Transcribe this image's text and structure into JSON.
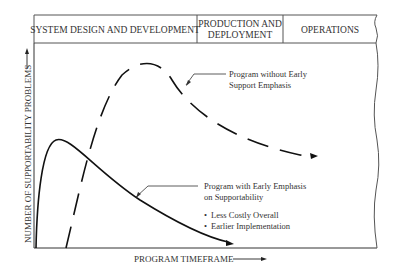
{
  "phases": [
    {
      "label": "SYSTEM DESIGN AND DEVELOPMENT"
    },
    {
      "label_line1": "PRODUCTION AND",
      "label_line2": "DEPLOYMENT"
    },
    {
      "label": "OPERATIONS"
    }
  ],
  "axes": {
    "y_label": "NUMBER OF SUPPORTABILITY PROBLEMS",
    "x_label": "PROGRAM TIMEFRAME"
  },
  "curves": {
    "without": {
      "label_line1": "Program without Early",
      "label_line2": "Support Emphasis",
      "style": "dashed"
    },
    "with": {
      "label_line1": "Program with Early Emphasis",
      "label_line2": "on Supportability",
      "style": "solid",
      "bullets": [
        "Less Costly Overall",
        "Earlier Implementation"
      ]
    }
  },
  "colors": {
    "line": "#111111",
    "text": "#333333",
    "border": "#555555"
  }
}
